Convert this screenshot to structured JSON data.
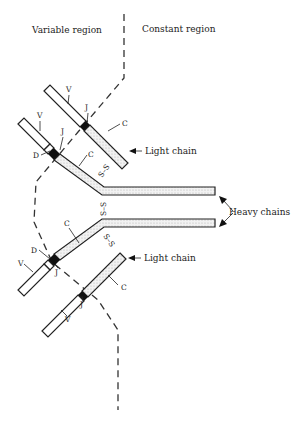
{
  "diagram": {
    "type": "antibody-structure",
    "region_labels": {
      "variable": "Variable region",
      "constant": "Constant region"
    },
    "chain_labels": {
      "light_top": "Light chain",
      "light_bottom": "Light chain",
      "heavy": "Heavy chains"
    },
    "segment_labels": {
      "v": "V",
      "d": "D",
      "j": "J",
      "c": "C"
    },
    "disulfide": {
      "top": "S–S",
      "middle": "S–S",
      "bottom": "S–S"
    },
    "colors": {
      "line": "#222222",
      "constant_fill": "#e8e8e8",
      "background": "#ffffff"
    }
  }
}
